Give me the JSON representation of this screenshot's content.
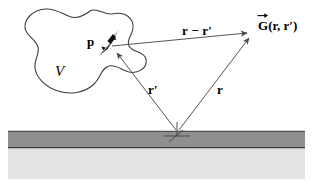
{
  "figure": {
    "background_color": "#ffffff",
    "width": 319,
    "height": 187
  },
  "labels": {
    "volume": "V",
    "dipole": "p",
    "source_position": "r′",
    "field_position": "r",
    "separation": "r − r′",
    "green_function_symbol": "G",
    "green_function_args": "(r, r′)"
  },
  "geometry": {
    "origin_point": {
      "x": 177,
      "y": 133
    },
    "dipole_point": {
      "x": 112,
      "y": 48
    },
    "field_point": {
      "x": 250,
      "y": 34
    },
    "dipole_arrow_tail": {
      "x": 99,
      "y": 55
    },
    "dipole_arrow_head": {
      "x": 118,
      "y": 31
    }
  },
  "blob": {
    "name": "source-volume-outline",
    "stroke_color": "#3d3d3d",
    "fill_color": "#ffffff",
    "stroke_width": 1.1
  },
  "vectors": [
    {
      "name": "r-prime-vector",
      "label": "r′",
      "from": "origin",
      "to": "dipole",
      "stroke_color": "#555555"
    },
    {
      "name": "r-vector",
      "label": "r",
      "from": "origin",
      "to": "field-point",
      "stroke_color": "#555555"
    },
    {
      "name": "r-minus-r-prime-vector",
      "label": "r − r′",
      "from": "dipole",
      "to": "field-point",
      "stroke_color": "#555555"
    },
    {
      "name": "dipole-moment-vector",
      "label": "p",
      "from": "dipole-tail",
      "to": "dipole-head",
      "stroke_color": "#000000"
    }
  ],
  "substrate": {
    "top_layer": {
      "name": "dark-slab-layer",
      "color": "#8f8f8f",
      "border_color": "#3a3a3a",
      "x": 8,
      "y": 131,
      "width": 297,
      "height": 17
    },
    "bottom_layer": {
      "name": "light-half-space-layer",
      "color": "#e3e3e3",
      "x": 8,
      "y": 148,
      "width": 297,
      "height": 31
    }
  },
  "origin_marker": {
    "name": "origin-axes-marker",
    "color": "#4a4a4a"
  }
}
